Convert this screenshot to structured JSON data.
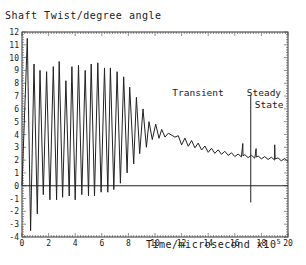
{
  "chart_data": {
    "type": "line",
    "title": "Shaft Twist/degree angle",
    "xlabel": "Time/microsecond x10^5",
    "ylabel": "Shaft Twist/degree angle",
    "xlim": [
      0,
      20
    ],
    "ylim": [
      -4,
      12
    ],
    "xticks": [
      0,
      2,
      4,
      6,
      8,
      10,
      12,
      14,
      16,
      18,
      20
    ],
    "yticks": [
      -4,
      -3,
      -2,
      -1,
      0,
      1,
      2,
      3,
      4,
      5,
      6,
      7,
      8,
      9,
      10,
      11,
      12
    ],
    "grid": false,
    "legend": null,
    "annotations": [
      {
        "text": "Transient",
        "x": 11.5,
        "y": 6.9
      },
      {
        "text": "Steady",
        "x": 16.6,
        "y": 6.9
      },
      {
        "text": "State",
        "x": 17.2,
        "y": 6.0
      },
      {
        "type": "vline",
        "x": 17.2,
        "y_range": [
          -1.3,
          7.1
        ]
      }
    ],
    "reference_lines": [
      {
        "type": "hline",
        "y": 0
      }
    ],
    "series": [
      {
        "name": "Shaft twist",
        "description": "Oscillation at ~0.45 period, peaks ~9-9.6 with troughs ~-1 until t~8, then decaying transient to steady value ~2",
        "peaks": [
          {
            "x": 0.4,
            "y": 11.5
          },
          {
            "x": 0.9,
            "y": 9.5
          },
          {
            "x": 1.35,
            "y": 9.0
          },
          {
            "x": 1.85,
            "y": 8.9
          },
          {
            "x": 2.35,
            "y": 9.3
          },
          {
            "x": 2.8,
            "y": 9.7
          },
          {
            "x": 3.3,
            "y": 8.2
          },
          {
            "x": 3.75,
            "y": 9.3
          },
          {
            "x": 4.25,
            "y": 9.4
          },
          {
            "x": 4.75,
            "y": 9.0
          },
          {
            "x": 5.2,
            "y": 9.5
          },
          {
            "x": 5.7,
            "y": 9.6
          },
          {
            "x": 6.2,
            "y": 9.2
          },
          {
            "x": 6.65,
            "y": 9.2
          },
          {
            "x": 7.15,
            "y": 8.9
          },
          {
            "x": 7.65,
            "y": 8.5
          },
          {
            "x": 8.1,
            "y": 7.7
          },
          {
            "x": 8.6,
            "y": 6.9
          },
          {
            "x": 9.1,
            "y": 6.0
          },
          {
            "x": 9.55,
            "y": 5.0
          },
          {
            "x": 10.05,
            "y": 4.8
          },
          {
            "x": 10.5,
            "y": 4.4
          },
          {
            "x": 11.0,
            "y": 4.1
          },
          {
            "x": 11.5,
            "y": 3.8
          }
        ],
        "troughs": [
          {
            "x": 0.65,
            "y": -3.5
          },
          {
            "x": 1.15,
            "y": -2.2
          },
          {
            "x": 1.6,
            "y": -0.7
          },
          {
            "x": 2.1,
            "y": -1.1
          },
          {
            "x": 2.6,
            "y": -1.1
          },
          {
            "x": 3.05,
            "y": -0.9
          },
          {
            "x": 3.55,
            "y": -0.8
          },
          {
            "x": 4.0,
            "y": -1.1
          },
          {
            "x": 4.5,
            "y": -0.7
          },
          {
            "x": 5.0,
            "y": -0.8
          },
          {
            "x": 5.45,
            "y": -0.8
          },
          {
            "x": 5.95,
            "y": -0.5
          },
          {
            "x": 6.45,
            "y": -0.5
          },
          {
            "x": 6.9,
            "y": -0.3
          },
          {
            "x": 7.4,
            "y": 0.2
          },
          {
            "x": 7.9,
            "y": 1.0
          },
          {
            "x": 8.4,
            "y": 1.7
          },
          {
            "x": 8.85,
            "y": 2.5
          },
          {
            "x": 9.35,
            "y": 3.0
          },
          {
            "x": 9.8,
            "y": 3.6
          },
          {
            "x": 10.3,
            "y": 3.7
          },
          {
            "x": 10.75,
            "y": 3.8
          }
        ],
        "tail": [
          {
            "x": 12,
            "y": 3.5
          },
          {
            "x": 13,
            "y": 3.2
          },
          {
            "x": 14,
            "y": 2.8
          },
          {
            "x": 15,
            "y": 2.6
          },
          {
            "x": 16,
            "y": 2.4
          },
          {
            "x": 17,
            "y": 2.3
          },
          {
            "x": 18,
            "y": 2.2
          },
          {
            "x": 19,
            "y": 2.1
          },
          {
            "x": 20,
            "y": 2.0
          }
        ],
        "spikes": [
          {
            "x": 16.6,
            "y": 3.3
          },
          {
            "x": 17.6,
            "y": 2.9
          },
          {
            "x": 19.0,
            "y": 3.2
          }
        ]
      }
    ]
  },
  "labels": {
    "title": "Shaft Twist/degree angle",
    "xlabel_main": "Time/microsecond x10",
    "xlabel_exp": "5",
    "annot_transient": "Transient",
    "annot_steady": "Steady",
    "annot_state": "State"
  }
}
